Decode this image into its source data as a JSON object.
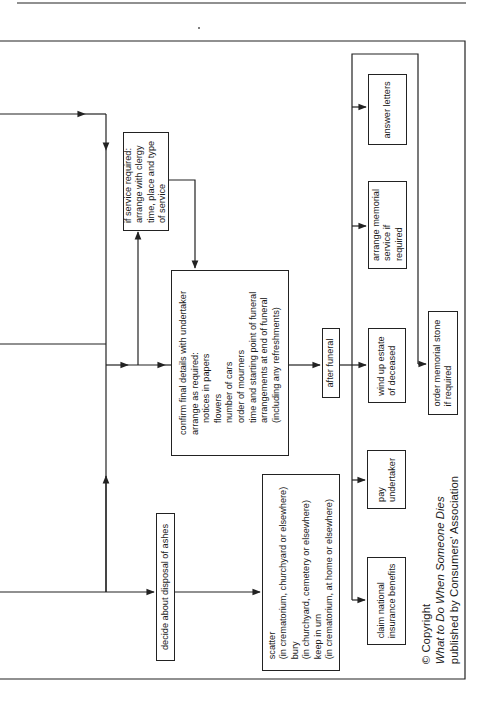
{
  "diagram": {
    "orientation": "rotated-90-ccw",
    "line_color": "#222222",
    "nodes": {
      "service": {
        "lines": [
          "if service required:",
          "arrange with clergy",
          "time, place and type",
          "of service"
        ]
      },
      "confirm": {
        "lines": [
          "confirm final details with undertaker",
          "arrange as required:"
        ],
        "sub_items": [
          "notices in papers",
          "flowers",
          "number of cars",
          "order of mourners",
          "time and starting point of funeral",
          "arrangements at end of funeral",
          "(including any refreshments)"
        ]
      },
      "after_funeral": {
        "label": "after funeral"
      },
      "answer_letters": {
        "label": "answer letters"
      },
      "arrange_memorial": {
        "lines": [
          "arrange memorial",
          "service if",
          "required"
        ]
      },
      "wind_up": {
        "lines": [
          "wind up estate",
          "of deceased"
        ]
      },
      "order_stone": {
        "lines": [
          "order memorial stone",
          "if required"
        ]
      },
      "pay_undertaker": {
        "lines": [
          "pay",
          "undertaker"
        ]
      },
      "claim_ni": {
        "lines": [
          "claim national",
          "insurance benefits"
        ]
      },
      "decide_ashes": {
        "label": "decide about disposal of ashes"
      },
      "ashes_options": {
        "lines": [
          "scatter",
          "(in crematorium, churchyard or elsewhere)",
          "bury",
          "(in churchyard, cemetery or elsewhere)",
          "keep in urn",
          "(in crematorium, at home or elsewhere)"
        ]
      }
    },
    "copyright": {
      "line1": "© Copyright",
      "line2": "What to Do When Someone Dies",
      "line3": "published by Consumers' Association"
    }
  }
}
